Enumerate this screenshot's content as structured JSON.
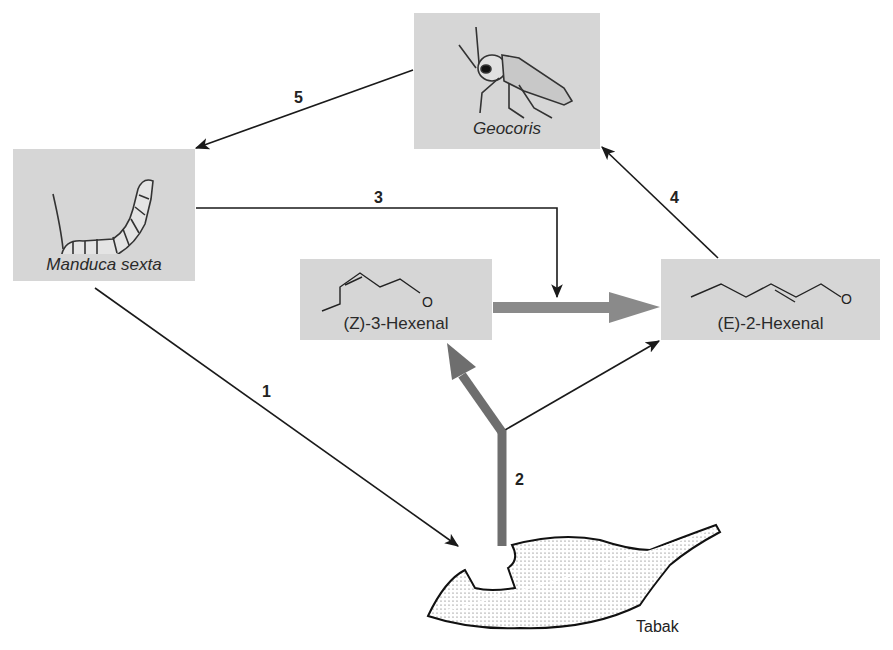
{
  "nodes": {
    "geocoris": {
      "label": "Geocoris",
      "icon": "bug-icon"
    },
    "manduca": {
      "label": "Manduca sexta",
      "icon": "caterpillar-icon"
    },
    "z3hexenal": {
      "label": "(Z)-3-Hexenal",
      "icon": "molecule-icon"
    },
    "e2hexenal": {
      "label": "(E)-2-Hexenal",
      "icon": "molecule-icon"
    },
    "tabak": {
      "label": "Tabak",
      "icon": "leaf-icon"
    }
  },
  "molecule_atom": "O",
  "arrows": [
    {
      "id": "1",
      "label": "1",
      "from": "Manduca sexta",
      "to": "Tabak"
    },
    {
      "id": "2",
      "label": "2",
      "from": "Tabak",
      "to": "(Z)-3-Hexenal / (E)-2-Hexenal"
    },
    {
      "id": "3",
      "label": "3",
      "from": "Manduca sexta",
      "to": "(Z)-3-Hexenal → (E)-2-Hexenal conversion"
    },
    {
      "id": "4",
      "label": "4",
      "from": "(E)-2-Hexenal",
      "to": "Geocoris"
    },
    {
      "id": "5",
      "label": "5",
      "from": "Geocoris",
      "to": "Manduca sexta"
    }
  ],
  "colors": {
    "box": "#d6d6d6",
    "thick_arrow": "#6e6e6e",
    "conversion_arrow": "#8a8a8a",
    "line": "#1a1a1a"
  }
}
